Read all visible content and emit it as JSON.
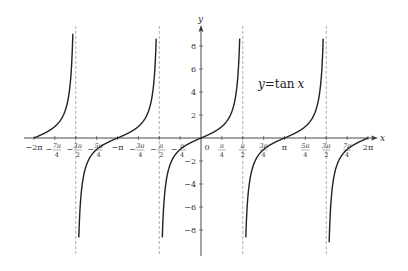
{
  "chart_data": {
    "type": "line",
    "title_parts": {
      "var": "y",
      "eq": "=",
      "fn": "tan",
      "arg": "x"
    },
    "xlabel": "x",
    "ylabel": "y",
    "function": "tan(x)",
    "xlim_pi": [
      -2,
      2
    ],
    "ylim": [
      -9.5,
      9.5
    ],
    "grid": false,
    "legend": "none",
    "asymptotes_pi": [
      -1.5,
      -0.5,
      0.5,
      1.5
    ],
    "x_ticks": [
      {
        "value_pi": -2,
        "label": "−2π",
        "frac": false
      },
      {
        "value_pi": -1.75,
        "num": "7π",
        "den": "4",
        "sign": "−",
        "frac": true
      },
      {
        "value_pi": -1.5,
        "num": "3π",
        "den": "2",
        "sign": "−",
        "frac": true
      },
      {
        "value_pi": -1.25,
        "num": "5π",
        "den": "4",
        "sign": "−",
        "frac": true
      },
      {
        "value_pi": -1,
        "label": "−π",
        "frac": false
      },
      {
        "value_pi": -0.75,
        "num": "3π",
        "den": "4",
        "sign": "−",
        "frac": true
      },
      {
        "value_pi": -0.5,
        "num": "π",
        "den": "2",
        "sign": "−",
        "frac": true
      },
      {
        "value_pi": -0.25,
        "num": "π",
        "den": "4",
        "sign": "−",
        "frac": true
      },
      {
        "value_pi": 0,
        "label": "0",
        "frac": false
      },
      {
        "value_pi": 0.25,
        "num": "π",
        "den": "4",
        "sign": "",
        "frac": true
      },
      {
        "value_pi": 0.5,
        "num": "π",
        "den": "2",
        "sign": "",
        "frac": true
      },
      {
        "value_pi": 0.75,
        "num": "3π",
        "den": "4",
        "sign": "",
        "frac": true
      },
      {
        "value_pi": 1,
        "label": "π",
        "frac": false
      },
      {
        "value_pi": 1.25,
        "num": "5π",
        "den": "4",
        "sign": "",
        "frac": true
      },
      {
        "value_pi": 1.5,
        "num": "3π",
        "den": "2",
        "sign": "",
        "frac": true
      },
      {
        "value_pi": 1.75,
        "num": "7π",
        "den": "4",
        "sign": "",
        "frac": true
      },
      {
        "value_pi": 2,
        "label": "2π",
        "frac": false
      }
    ],
    "y_ticks": [
      {
        "value": 8,
        "label": "8"
      },
      {
        "value": 6,
        "label": "6"
      },
      {
        "value": 4,
        "label": "4"
      },
      {
        "value": 2,
        "label": "2"
      },
      {
        "value": -2,
        "label": "−2"
      },
      {
        "value": -4,
        "label": "−4"
      },
      {
        "value": -6,
        "label": "−6"
      },
      {
        "value": -8,
        "label": "−8"
      }
    ],
    "branches_pi": [
      [
        -2,
        -1.5
      ],
      [
        -1.5,
        -0.5
      ],
      [
        -0.5,
        0.5
      ],
      [
        0.5,
        1.5
      ],
      [
        1.5,
        2
      ]
    ],
    "curve_color": "#222222",
    "asymptote_color": "#999999",
    "axis_color": "#333333"
  }
}
